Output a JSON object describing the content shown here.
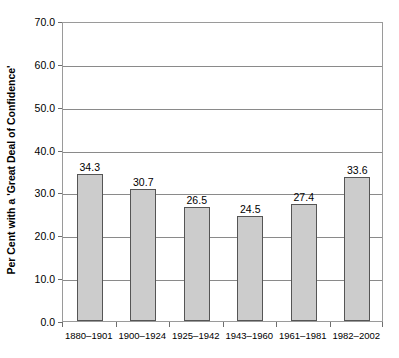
{
  "chart_data": {
    "type": "bar",
    "title": "",
    "subtitle": "",
    "xlabel": "",
    "ylabel": "Per Cent with a 'Great Deal of Confidence'",
    "categories": [
      "1880–1901",
      "1900–1924",
      "1925–1942",
      "1943–1960",
      "1961–1981",
      "1982–2002"
    ],
    "values": [
      34.3,
      30.7,
      26.5,
      24.5,
      27.4,
      33.6
    ],
    "value_labels": [
      "34.3",
      "30.7",
      "26.5",
      "24.5",
      "27.4",
      "33.6"
    ],
    "ylim": [
      0.0,
      70.0
    ],
    "ytick_step": 10.0,
    "ytick_labels": [
      "0.0",
      "10.0",
      "20.0",
      "30.0",
      "40.0",
      "50.0",
      "60.0",
      "70.0"
    ],
    "ytick_values": [
      0.0,
      10.0,
      20.0,
      30.0,
      40.0,
      50.0,
      60.0,
      70.0
    ],
    "grid": "horizontal",
    "legend": "none",
    "colors": {
      "bar_fill": "#cccccc",
      "bar_stroke": "#555555",
      "gridline": "#8a8a8a",
      "axis": "#9a9a9a",
      "text": "#000000",
      "background": "#ffffff"
    }
  }
}
